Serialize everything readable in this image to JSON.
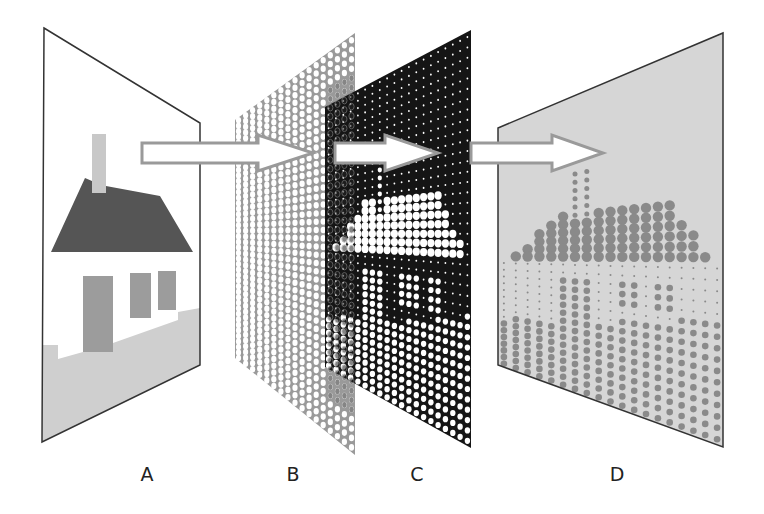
{
  "figure": {
    "labels": [
      {
        "id": "A",
        "text": "A",
        "x": 147
      },
      {
        "id": "B",
        "text": "B",
        "x": 293
      },
      {
        "id": "C",
        "text": "C",
        "x": 417
      },
      {
        "id": "D",
        "text": "D",
        "x": 617
      }
    ],
    "panels": {
      "A": {
        "name": "original-image-panel",
        "quad": [
          [
            44,
            28
          ],
          [
            200,
            123
          ],
          [
            200,
            365
          ],
          [
            42,
            442
          ]
        ],
        "fill": "#ffffff",
        "stroke": "#333333"
      },
      "B": {
        "name": "screen-grid-panel",
        "quad": [
          [
            235,
            120
          ],
          [
            355,
            33
          ],
          [
            355,
            455
          ],
          [
            235,
            358
          ]
        ],
        "grid_color": "#9a9a9a"
      },
      "C": {
        "name": "screened-image-panel",
        "quad": [
          [
            325,
            107
          ],
          [
            471,
            30
          ],
          [
            471,
            448
          ],
          [
            325,
            367
          ]
        ],
        "fill": "#151515",
        "dot_color": "#ffffff"
      },
      "D": {
        "name": "halftone-result-panel",
        "quad": [
          [
            498,
            128
          ],
          [
            723,
            33
          ],
          [
            723,
            447
          ],
          [
            498,
            365
          ]
        ],
        "fill": "#d6d6d6",
        "dot_color": "#8a8a8a",
        "stroke": "#333333"
      }
    },
    "house": {
      "roof_color": "#555555",
      "wall_color": "#ffffff",
      "window_color": "#9c9c9c",
      "chimney_color": "#c8c8c8",
      "ground_color": "#cfcfcf"
    },
    "arrows": [
      {
        "name": "arrow-a-to-b",
        "x1": 142,
        "x2": 258,
        "tip": 313
      },
      {
        "name": "arrow-b-to-c",
        "x1": 335,
        "x2": 385,
        "tip": 438
      },
      {
        "name": "arrow-c-to-d",
        "x1": 471,
        "x2": 552,
        "tip": 603
      }
    ],
    "arrow_style": {
      "y_center": 153,
      "shaft_half": 10,
      "head_half": 18,
      "fill": "#ffffff",
      "stroke": "#9a9a9a"
    }
  }
}
